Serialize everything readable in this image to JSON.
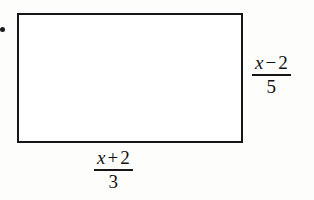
{
  "figure": {
    "type": "rectangle-with-labeled-sides",
    "background_color": "#fdfdfc",
    "stroke_color": "#161616",
    "fill_color": "#ffffff",
    "marker": {
      "name": "margin-dot",
      "shape": "filled-circle",
      "color": "#1a1a1a"
    },
    "shape": {
      "name": "rectangle",
      "x": 17,
      "y": 13,
      "width": 226,
      "height": 130,
      "stroke_width": 2
    },
    "labels": {
      "right": {
        "role": "height",
        "expression": "(x - 2)/5",
        "numerator_variable": "x",
        "numerator_operator": "−",
        "numerator_constant": "2",
        "denominator": "5"
      },
      "bottom": {
        "role": "width",
        "expression": "(x + 2)/3",
        "numerator_variable": "x",
        "numerator_operator": "+",
        "numerator_constant": "2",
        "denominator": "3"
      }
    }
  }
}
